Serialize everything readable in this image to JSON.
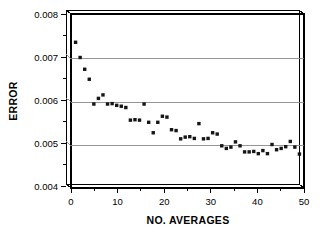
{
  "chart_data": {
    "type": "scatter",
    "title": "",
    "subtitle": "",
    "xlabel": "NO. AVERAGES",
    "ylabel": "ERROR",
    "xlim": [
      0,
      51
    ],
    "ylim": [
      0.004,
      0.008
    ],
    "xticks": [
      0,
      10,
      20,
      30,
      40,
      50
    ],
    "xtick_labels": [
      "0",
      "10",
      "20",
      "30",
      "40",
      "50"
    ],
    "xminor_ticks": [
      5,
      15,
      25,
      35,
      45
    ],
    "yticks": [
      0.004,
      0.005,
      0.006,
      0.007,
      0.008
    ],
    "ytick_labels": [
      "0.004",
      "0.005",
      "0.006",
      "0.007",
      "0.008"
    ],
    "yminor_ticks": [
      0.0045,
      0.0055,
      0.0065,
      0.0075
    ],
    "grid": "horizontal-major",
    "gridlines_y": [
      0.005,
      0.006,
      0.007
    ],
    "legend": "none",
    "marker_style": "filled-square",
    "marker_color": "#151515",
    "frame_style": "offset-3d-box",
    "series": [
      {
        "name": "error",
        "x": [
          1,
          2,
          3,
          4,
          5,
          6,
          7,
          8,
          9,
          10,
          11,
          12,
          13,
          14,
          15,
          16,
          17,
          18,
          19,
          20,
          21,
          22,
          23,
          24,
          25,
          26,
          27,
          28,
          29,
          30,
          31,
          32,
          33,
          34,
          35,
          36,
          37,
          38,
          39,
          40,
          41,
          42,
          43,
          44,
          45,
          46,
          47,
          48,
          49,
          50
        ],
        "y": [
          0.00735,
          0.007,
          0.00673,
          0.0065,
          0.00593,
          0.00606,
          0.00614,
          0.00593,
          0.00594,
          0.0059,
          0.00588,
          0.00585,
          0.00556,
          0.00557,
          0.00556,
          0.00593,
          0.00551,
          0.00527,
          0.00551,
          0.00565,
          0.00563,
          0.00534,
          0.00532,
          0.00513,
          0.00517,
          0.00518,
          0.00514,
          0.00548,
          0.00513,
          0.00514,
          0.00527,
          0.00524,
          0.00497,
          0.00491,
          0.00494,
          0.00506,
          0.00497,
          0.00483,
          0.00483,
          0.00484,
          0.00479,
          0.00486,
          0.00479,
          0.005,
          0.00488,
          0.00491,
          0.00495,
          0.00507,
          0.00494,
          0.00478
        ]
      }
    ]
  },
  "axes": {
    "y_axis_name": "ERROR",
    "x_axis_name": "NO. AVERAGES"
  }
}
